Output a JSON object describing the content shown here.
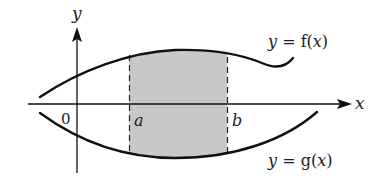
{
  "diagram": {
    "type": "area-between-curves",
    "axes": {
      "x_label": "x",
      "y_label": "y",
      "origin_label": "0"
    },
    "bounds": {
      "lower_label": "a",
      "upper_label": "b"
    },
    "curves": [
      {
        "id": "f",
        "label_prefix": "y = ",
        "label_func": "f",
        "label_arg": "(x)",
        "label": "y = f(x)",
        "position": "upper"
      },
      {
        "id": "g",
        "label_prefix": "y = ",
        "label_func": "g",
        "label_arg": "(x)",
        "label": "y = g(x)",
        "position": "lower"
      }
    ],
    "shaded_region": {
      "description": "Area between f(x) and g(x) from x = a to x = b",
      "fill_color": "#c8c8c8"
    },
    "colors": {
      "stroke": "#111111",
      "shade": "#c8c8c8",
      "background": "#ffffff"
    }
  }
}
